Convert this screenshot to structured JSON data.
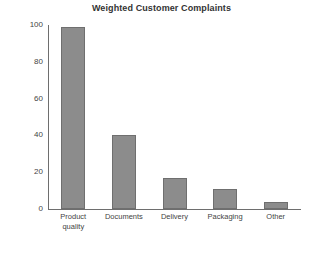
{
  "chart_data": {
    "type": "bar",
    "title": "Weighted Customer Complaints",
    "xlabel": "",
    "ylabel": "",
    "categories": [
      "Product quality",
      "Documents",
      "Delivery",
      "Packaging",
      "Other"
    ],
    "category_lines": [
      [
        "Product",
        "quality"
      ],
      [
        "Documents"
      ],
      [
        "Delivery"
      ],
      [
        "Packaging"
      ],
      [
        "Other"
      ]
    ],
    "values": [
      99,
      40,
      17,
      11,
      4
    ],
    "ylim": [
      0,
      100
    ],
    "yticks": [
      0,
      20,
      40,
      60,
      80,
      100
    ],
    "ytick_labels": [
      "0",
      "20",
      "40",
      "60",
      "80",
      "100"
    ],
    "grid": false,
    "legend": false,
    "bar_color": "#8c8c8c",
    "bar_border_color": "#6f6f6f",
    "axis_color": "#6e6e6e",
    "text_color": "#444444",
    "background": "#ffffff"
  }
}
